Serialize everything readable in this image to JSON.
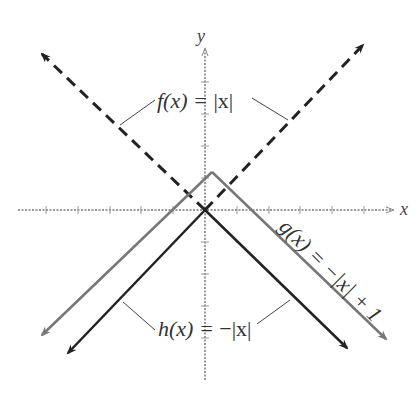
{
  "axes": {
    "x_label": "x",
    "y_label": "y"
  },
  "functions": [
    {
      "name": "f",
      "label": "f(x) = |x|",
      "style": "dashed",
      "color": "#222222"
    },
    {
      "name": "g",
      "label": "g(x) = −|x| + 1",
      "style": "solid",
      "color": "#777777"
    },
    {
      "name": "h",
      "label": "h(x) = −|x|",
      "style": "solid",
      "color": "#222222"
    }
  ],
  "labels": {
    "f_lhs": "f(x) = ",
    "f_rhs": "|x|",
    "g": "g(x) = −|x| + 1",
    "h_lhs": "h(x) = ",
    "h_rhs": "−|x|"
  }
}
